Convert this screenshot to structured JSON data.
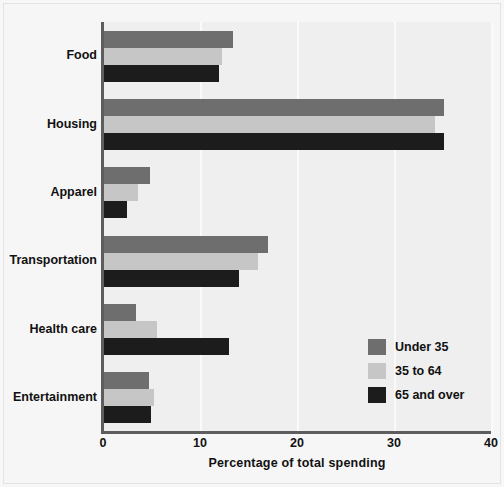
{
  "chart_data": {
    "type": "bar",
    "orientation": "horizontal",
    "title": "",
    "xlabel": "Percentage of total spending",
    "ylabel": "",
    "xlim": [
      0,
      40
    ],
    "xticks": [
      0,
      10,
      20,
      30,
      40
    ],
    "grid": true,
    "legend_position": "lower right",
    "categories": [
      "Food",
      "Housing",
      "Apparel",
      "Transportation",
      "Health care",
      "Entertainment"
    ],
    "series": [
      {
        "name": "Under 35",
        "color": "#6e6e6e",
        "values": [
          13.4,
          35.2,
          4.8,
          17.0,
          3.4,
          4.7
        ]
      },
      {
        "name": "35 to 64",
        "color": "#c6c6c6",
        "values": [
          12.3,
          34.2,
          3.6,
          16.0,
          5.6,
          5.3
        ]
      },
      {
        "name": "65 and over",
        "color": "#1c1c1c",
        "values": [
          12.0,
          35.2,
          2.5,
          14.0,
          13.0,
          4.9
        ]
      }
    ]
  },
  "axis": {
    "x_tick_labels": [
      "0",
      "10",
      "20",
      "30",
      "40"
    ],
    "x_title": "Percentage of total spending"
  },
  "legend": {
    "entries": [
      {
        "label": "Under 35",
        "color": "#6e6e6e"
      },
      {
        "label": "35 to 64",
        "color": "#c6c6c6"
      },
      {
        "label": "65 and over",
        "color": "#1c1c1c"
      }
    ]
  },
  "style": {
    "figure_background": "#f6f6f6",
    "plot_background": "#efefef",
    "gridline_color": "#fafafa",
    "axis_color": "#5d5d5d",
    "text_color": "#111111"
  }
}
